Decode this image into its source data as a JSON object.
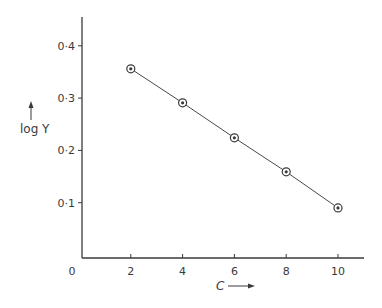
{
  "chart_data": {
    "type": "line",
    "title": "",
    "xlabel": "C",
    "ylabel": "log Y",
    "x": [
      2,
      4,
      6,
      8,
      10
    ],
    "series": [
      {
        "name": "log Y",
        "values": [
          0.356,
          0.291,
          0.224,
          0.159,
          0.09
        ],
        "marker": "circled-dot"
      }
    ],
    "xticks": [
      0,
      2,
      4,
      6,
      8,
      10
    ],
    "xtick_labels": [
      "0",
      "2",
      "4",
      "6",
      "8",
      "10"
    ],
    "yticks": [
      0.1,
      0.2,
      0.3,
      0.4
    ],
    "ytick_labels": [
      "0·1",
      "0·2",
      "0·3",
      "0·4"
    ],
    "xlim": [
      0,
      11
    ],
    "ylim": [
      0,
      0.46
    ],
    "grid": false,
    "legend": null
  },
  "axes": {
    "xlabel_text": "C",
    "ylabel_text": "log Y",
    "origin_label": "0"
  },
  "colors": {
    "ink": "#3a3a3a",
    "background": "#ffffff"
  }
}
